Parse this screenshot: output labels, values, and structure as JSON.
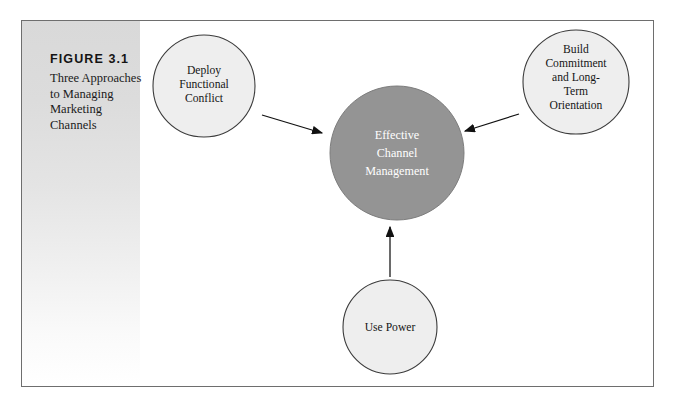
{
  "figure": {
    "number_label": "FIGURE 3.1",
    "title": "Three Approaches to Managing Marketing Channels",
    "frame_border_color": "#6e6e6e",
    "caption_background": "#d9d9d9"
  },
  "diagram": {
    "type": "concept-diagram",
    "center_node": {
      "id": "effective-channel-management",
      "lines": [
        "Effective",
        "Channel",
        "Management"
      ],
      "shape": "circle",
      "fill_color": "#949494",
      "text_color": "#ffffff",
      "cx": 397,
      "cy": 153,
      "r": 67
    },
    "outer_nodes": [
      {
        "id": "deploy-functional-conflict",
        "lines": [
          "Deploy",
          "Functional",
          "Conflict"
        ],
        "shape": "circle",
        "fill_color": "#eeeeee",
        "text_color": "#151515",
        "cx": 204,
        "cy": 86,
        "r": 51
      },
      {
        "id": "build-commitment",
        "lines": [
          "Build",
          "Commitment",
          "and Long-",
          "Term",
          "Orientation"
        ],
        "shape": "ellipse",
        "fill_color": "#eeeeee",
        "text_color": "#151515",
        "cx": 576,
        "cy": 82,
        "rx": 53,
        "ry": 52
      },
      {
        "id": "use-power",
        "lines": [
          "Use Power"
        ],
        "shape": "circle",
        "fill_color": "#eeeeee",
        "text_color": "#151515",
        "cx": 390,
        "cy": 327,
        "r": 47
      }
    ],
    "arrows": [
      {
        "id": "arrow-conflict-to-center",
        "from": "deploy-functional-conflict",
        "to": "effective-channel-management",
        "direction": "down-right",
        "color": "#111111"
      },
      {
        "id": "arrow-commitment-to-center",
        "from": "build-commitment",
        "to": "effective-channel-management",
        "direction": "down-left",
        "color": "#111111"
      },
      {
        "id": "arrow-power-to-center",
        "from": "use-power",
        "to": "effective-channel-management",
        "direction": "up",
        "color": "#111111"
      }
    ]
  }
}
